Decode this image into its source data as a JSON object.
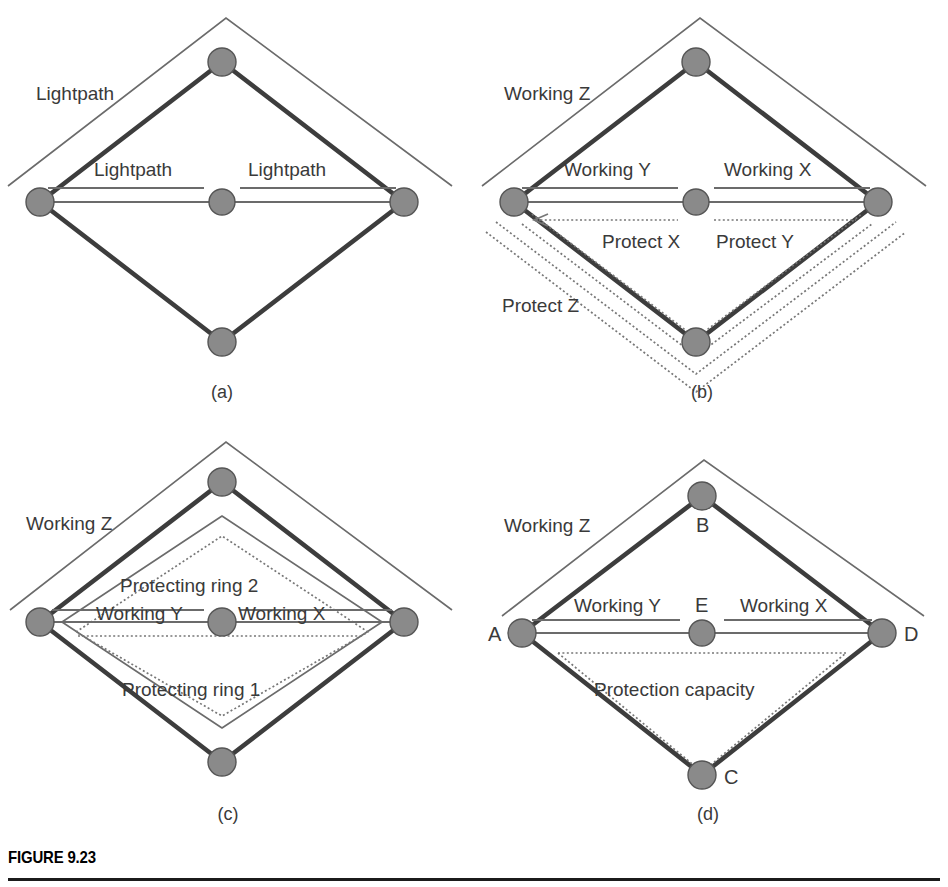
{
  "figure": {
    "label": "FIGURE 9.23",
    "panels": [
      {
        "id": "a",
        "caption": "(a)",
        "nodes": [
          {
            "id": "A",
            "label": "",
            "x": 40,
            "y": 202
          },
          {
            "id": "B",
            "label": "",
            "x": 222,
            "y": 62
          },
          {
            "id": "C",
            "label": "",
            "x": 222,
            "y": 342
          },
          {
            "id": "D",
            "label": "",
            "x": 404,
            "y": 202
          },
          {
            "id": "E",
            "label": "",
            "x": 222,
            "y": 202
          }
        ],
        "annotations": [
          {
            "name": "lightpath-z",
            "text": "Lightpath",
            "x": 36,
            "y": 100,
            "style": "plain"
          },
          {
            "name": "lightpath-y",
            "text": "Lightpath",
            "x": 94,
            "y": 176,
            "style": "plain"
          },
          {
            "name": "lightpath-x",
            "text": "Lightpath",
            "x": 248,
            "y": 176,
            "style": "plain"
          }
        ]
      },
      {
        "id": "b",
        "caption": "(b)",
        "nodes": [
          {
            "id": "A",
            "label": "",
            "x": 40,
            "y": 202
          },
          {
            "id": "B",
            "label": "",
            "x": 222,
            "y": 62
          },
          {
            "id": "C",
            "label": "",
            "x": 222,
            "y": 342
          },
          {
            "id": "D",
            "label": "",
            "x": 404,
            "y": 202
          },
          {
            "id": "E",
            "label": "",
            "x": 222,
            "y": 202
          }
        ],
        "annotations": [
          {
            "name": "working-z",
            "text": "Working",
            "suffix": "Z",
            "x": 30,
            "y": 100,
            "style": "ital"
          },
          {
            "name": "working-y",
            "text": "Working",
            "suffix": "Y",
            "x": 90,
            "y": 176,
            "style": "ital"
          },
          {
            "name": "working-x",
            "text": "Working",
            "suffix": "X",
            "x": 250,
            "y": 176,
            "style": "ital"
          },
          {
            "name": "protect-x",
            "text": "Protect",
            "suffix": "X",
            "x": 128,
            "y": 243,
            "style": "ital"
          },
          {
            "name": "protect-y",
            "text": "Protect",
            "suffix": "Y",
            "x": 242,
            "y": 243,
            "style": "ital"
          },
          {
            "name": "protect-z",
            "text": "Protect",
            "suffix": "Z",
            "x": 30,
            "y": 308,
            "style": "ital"
          }
        ]
      },
      {
        "id": "c",
        "caption": "(c)",
        "nodes": [
          {
            "id": "A",
            "label": "",
            "x": 40,
            "y": 202
          },
          {
            "id": "B",
            "label": "",
            "x": 222,
            "y": 62
          },
          {
            "id": "C",
            "label": "",
            "x": 222,
            "y": 342
          },
          {
            "id": "D",
            "label": "",
            "x": 404,
            "y": 202
          },
          {
            "id": "E",
            "label": "",
            "x": 222,
            "y": 202
          }
        ],
        "annotations": [
          {
            "name": "working-z",
            "text": "Working",
            "suffix": "Z",
            "x": 26,
            "y": 110,
            "style": "ital"
          },
          {
            "name": "protecting-ring-2",
            "text": "Protecting ring 2",
            "x": 120,
            "y": 166,
            "style": "plain"
          },
          {
            "name": "working-y",
            "text": "Working",
            "suffix": "Y",
            "x": 96,
            "y": 196,
            "style": "ital"
          },
          {
            "name": "working-x",
            "text": "Working",
            "suffix": "X",
            "x": 240,
            "y": 196,
            "style": "ital"
          },
          {
            "name": "protecting-ring-1",
            "text": "Protecting ring 1",
            "x": 122,
            "y": 270,
            "style": "plain"
          }
        ]
      },
      {
        "id": "d",
        "caption": "(d)",
        "nodes": [
          {
            "id": "A",
            "label": "A",
            "x": 48,
            "y": 213
          },
          {
            "id": "B",
            "label": "B",
            "x": 228,
            "y": 76
          },
          {
            "id": "C",
            "label": "C",
            "x": 228,
            "y": 355
          },
          {
            "id": "D",
            "label": "D",
            "x": 408,
            "y": 213
          },
          {
            "id": "E",
            "label": "E",
            "x": 228,
            "y": 213
          }
        ],
        "annotations": [
          {
            "name": "working-z",
            "text": "Working",
            "suffix": "Z",
            "x": 30,
            "y": 112,
            "style": "ital"
          },
          {
            "name": "working-y",
            "text": "Working",
            "suffix": "Y",
            "x": 100,
            "y": 192,
            "style": "ital"
          },
          {
            "name": "working-x",
            "text": "Working",
            "suffix": "X",
            "x": 268,
            "y": 192,
            "style": "ital"
          },
          {
            "name": "protection-capacity",
            "text": "Protection capacity",
            "x": 120,
            "y": 270,
            "style": "plain"
          }
        ]
      }
    ]
  },
  "colors": {
    "node_fill": "#8a8a8a",
    "node_stroke": "#555555",
    "edge": "#3d3d3d",
    "thin_line": "#6b6b6b",
    "dotted_line": "#777777",
    "text": "#3a3a3a",
    "caption_text": "#3a3a3a",
    "rule": "#1b1b1b"
  }
}
